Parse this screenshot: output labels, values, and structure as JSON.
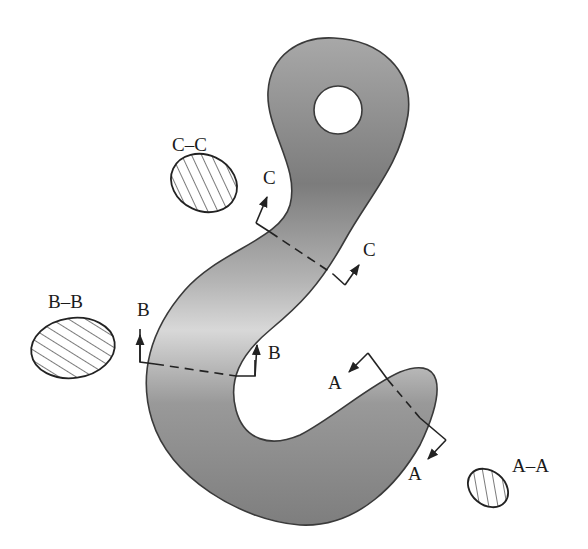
{
  "diagram": {
    "colors": {
      "hook_dark": "#7a7a7a",
      "hook_light": "#d6d6d6",
      "outline": "#3a3a3a",
      "hatch": "#333333",
      "background": "#ffffff"
    },
    "sections": [
      {
        "id": "A",
        "cut_labels": [
          "A",
          "A"
        ],
        "view_label": "A–A",
        "location": "hook tip"
      },
      {
        "id": "B",
        "cut_labels": [
          "B",
          "B"
        ],
        "view_label": "B–B",
        "location": "hook bend (left side)"
      },
      {
        "id": "C",
        "cut_labels": [
          "C",
          "C"
        ],
        "view_label": "C–C",
        "location": "hook shank (neck)"
      }
    ],
    "labels": {
      "a_cut_top": "A",
      "a_cut_bottom": "A",
      "a_view": "A–A",
      "b_cut_left": "B",
      "b_cut_right": "B",
      "b_view": "B–B",
      "c_cut_top": "C",
      "c_cut_right": "C",
      "c_view": "C–C"
    }
  }
}
